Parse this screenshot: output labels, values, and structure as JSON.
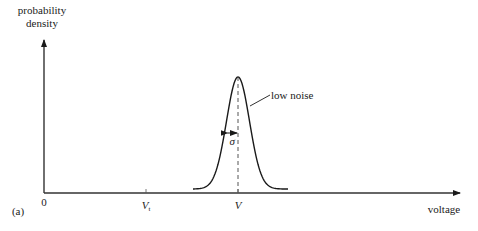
{
  "chart_data": {
    "type": "line",
    "title": "",
    "panel_label": "(a)",
    "ylabel_line1": "probability",
    "ylabel_line2": "density",
    "xlabel": "voltage",
    "origin_label": "0",
    "x_ticks": [
      {
        "label": "V",
        "subscript": "t",
        "value": 0.25
      },
      {
        "label": "V",
        "subscript": "",
        "value": 0.5
      }
    ],
    "series": [
      {
        "name": "low noise",
        "distribution": "gaussian",
        "mean": 0.5,
        "sigma": 0.03,
        "peak": 1.0
      }
    ],
    "annotations": {
      "curve_label": "low noise",
      "sigma_label": "σ"
    },
    "xlim": [
      0,
      1
    ],
    "ylim": [
      0,
      1.2
    ],
    "grid": false
  }
}
